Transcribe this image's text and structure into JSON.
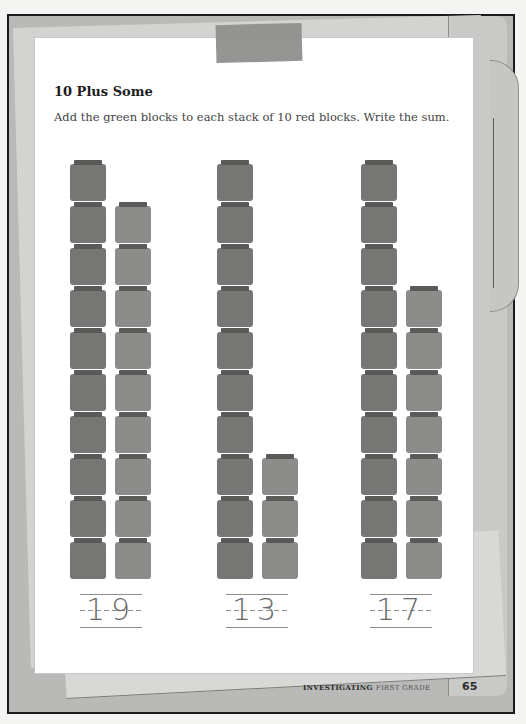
{
  "worksheet": {
    "title": "10 Plus Some",
    "instructions": "Add the green blocks to each stack of 10 red blocks. Write the sum.",
    "name_label": "Name",
    "problems": [
      {
        "red_blocks": 10,
        "green_blocks": 9,
        "sum": "19",
        "red_x": 70,
        "green_x": 115,
        "lines_x": 80
      },
      {
        "red_blocks": 10,
        "green_blocks": 3,
        "sum": "13",
        "red_x": 217,
        "green_x": 262,
        "lines_x": 226
      },
      {
        "red_blocks": 10,
        "green_blocks": 7,
        "sum": "17",
        "red_x": 361,
        "green_x": 406,
        "lines_x": 370
      }
    ]
  },
  "footer": {
    "brand": "INVESTIGATING",
    "grade": "FIRST GRADE",
    "page_number": "65"
  },
  "colors": {
    "red_block": "#767674",
    "green_block": "#8c8c8a",
    "block_cap": "#5a5a58",
    "page": "#ffffff",
    "frame": "#b9b9b7"
  }
}
